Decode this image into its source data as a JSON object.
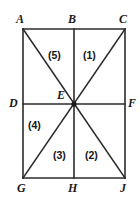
{
  "figure": {
    "canvas": {
      "width": 140,
      "height": 204
    },
    "colors": {
      "background": "#ffffff",
      "stroke": "#2b2b2b",
      "label": "#1a1a1a",
      "vertex_dot": "#1a1a1a"
    },
    "stroke_width": 1.6,
    "vertices": [
      {
        "id": "A",
        "label": "A",
        "x": 23,
        "y": 29,
        "label_x": 16,
        "label_y": 13,
        "dot": false
      },
      {
        "id": "B",
        "label": "B",
        "x": 74,
        "y": 29,
        "label_x": 68,
        "label_y": 13,
        "dot": false
      },
      {
        "id": "C",
        "label": "C",
        "x": 125,
        "y": 29,
        "label_x": 119,
        "label_y": 13,
        "dot": false
      },
      {
        "id": "D",
        "label": "D",
        "x": 23,
        "y": 104,
        "label_x": 9,
        "label_y": 97,
        "dot": false
      },
      {
        "id": "E",
        "label": "E",
        "x": 74,
        "y": 104,
        "label_x": 57,
        "label_y": 89,
        "dot": true
      },
      {
        "id": "F",
        "label": "F",
        "x": 125,
        "y": 104,
        "label_x": 128,
        "label_y": 97,
        "dot": false
      },
      {
        "id": "G",
        "label": "G",
        "x": 23,
        "y": 178,
        "label_x": 17,
        "label_y": 182,
        "dot": false
      },
      {
        "id": "H",
        "label": "H",
        "x": 74,
        "y": 178,
        "label_x": 68,
        "label_y": 182,
        "dot": false
      },
      {
        "id": "J",
        "label": "J",
        "x": 125,
        "y": 178,
        "label_x": 120,
        "label_y": 182,
        "dot": false
      }
    ],
    "segments": [
      {
        "id": "AC",
        "name": "top-edge",
        "x1": 23,
        "y1": 29,
        "x2": 125,
        "y2": 29
      },
      {
        "id": "GJ",
        "name": "bottom-edge",
        "x1": 23,
        "y1": 178,
        "x2": 125,
        "y2": 178
      },
      {
        "id": "AG",
        "name": "left-edge",
        "x1": 23,
        "y1": 29,
        "x2": 23,
        "y2": 178
      },
      {
        "id": "CJ",
        "name": "right-edge",
        "x1": 125,
        "y1": 29,
        "x2": 125,
        "y2": 178
      },
      {
        "id": "BH",
        "name": "vertical-midline",
        "x1": 74,
        "y1": 29,
        "x2": 74,
        "y2": 178
      },
      {
        "id": "DF",
        "name": "horizontal-midline",
        "x1": 23,
        "y1": 104,
        "x2": 125,
        "y2": 104
      },
      {
        "id": "AJ",
        "name": "diagonal-a-j",
        "x1": 23,
        "y1": 29,
        "x2": 125,
        "y2": 178
      },
      {
        "id": "CG",
        "name": "diagonal-c-g",
        "x1": 125,
        "y1": 29,
        "x2": 23,
        "y2": 178
      }
    ],
    "regions": [
      {
        "id": "r5",
        "label": "(5)",
        "x": 48,
        "y": 50
      },
      {
        "id": "r1",
        "label": "(1)",
        "x": 83,
        "y": 50
      },
      {
        "id": "r4",
        "label": "(4)",
        "x": 28,
        "y": 120
      },
      {
        "id": "r3",
        "label": "(3)",
        "x": 53,
        "y": 150
      },
      {
        "id": "r2",
        "label": "(2)",
        "x": 85,
        "y": 150
      }
    ]
  }
}
